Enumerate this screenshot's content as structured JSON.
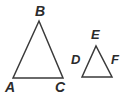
{
  "figure": {
    "kind": "geometry-diagram",
    "background_color": "#ffffff",
    "stroke_color": "#3a3a3a",
    "label_color": "#2b2b2b",
    "stroke_width": 1.5,
    "width": 126,
    "height": 99
  },
  "shapes": [
    {
      "id": "triangle-abc",
      "name": "triangle-abc",
      "type": "triangle",
      "points": "13,78 39,21 63,78",
      "vertices": [
        {
          "label": "A",
          "x": 13,
          "y": 78
        },
        {
          "label": "B",
          "x": 39,
          "y": 21
        },
        {
          "label": "C",
          "x": 63,
          "y": 78
        }
      ]
    },
    {
      "id": "triangle-def",
      "name": "triangle-def",
      "type": "triangle",
      "points": "82,77 96,46 112,77",
      "vertices": [
        {
          "label": "D",
          "x": 82,
          "y": 77
        },
        {
          "label": "E",
          "x": 96,
          "y": 46
        },
        {
          "label": "F",
          "x": 112,
          "y": 77
        }
      ]
    }
  ],
  "labels": {
    "A": "A",
    "B": "B",
    "C": "C",
    "D": "D",
    "E": "E",
    "F": "F"
  }
}
